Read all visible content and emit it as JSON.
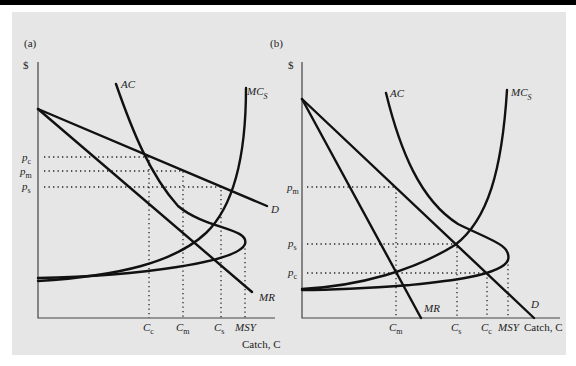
{
  "figure": {
    "panels": [
      {
        "id": "a",
        "label": "(a)",
        "y_axis_label": "$",
        "x_axis_label": "Catch, C",
        "curves": {
          "AC": "AC",
          "MC": "MC",
          "MC_sub": "S",
          "D": "D",
          "MR": "MR"
        },
        "price_labels": [
          {
            "base": "p",
            "sub": "c"
          },
          {
            "base": "p",
            "sub": "m"
          },
          {
            "base": "p",
            "sub": "s"
          }
        ],
        "catch_labels": [
          {
            "base": "C",
            "sub": "c"
          },
          {
            "base": "C",
            "sub": "m"
          },
          {
            "base": "C",
            "sub": "s"
          },
          {
            "base": "MSY",
            "sub": ""
          }
        ]
      },
      {
        "id": "b",
        "label": "(b)",
        "y_axis_label": "$",
        "x_axis_label": "Catch, C",
        "curves": {
          "AC": "AC",
          "MC": "MC",
          "MC_sub": "S",
          "D": "D",
          "MR": "MR"
        },
        "price_labels": [
          {
            "base": "p",
            "sub": "m"
          },
          {
            "base": "p",
            "sub": "s"
          },
          {
            "base": "p",
            "sub": "c"
          }
        ],
        "catch_labels": [
          {
            "base": "C",
            "sub": "m"
          },
          {
            "base": "C",
            "sub": "s"
          },
          {
            "base": "C",
            "sub": "c"
          },
          {
            "base": "MSY",
            "sub": ""
          }
        ]
      }
    ]
  },
  "colors": {
    "background": "#e6e6e6",
    "top_bar": "#000000",
    "ink": "#111111"
  }
}
